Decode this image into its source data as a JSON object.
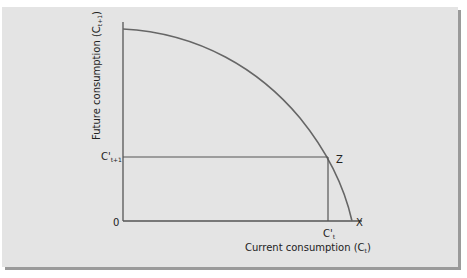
{
  "diagram": {
    "y_axis_label": "Future consumption (C",
    "y_axis_sub": "t+1",
    "y_axis_close": ")",
    "x_axis_label": "Current consumption (C",
    "x_axis_sub": "t",
    "x_axis_close": ")",
    "origin_label": "0",
    "y_tick_label": "C'",
    "y_tick_sub": "t+1",
    "x_tick_label": "C'",
    "x_tick_sub": "t",
    "point_z_label": "Z",
    "point_x_label": "X",
    "colors": {
      "panel": "#e4e4e4",
      "line": "#555555",
      "shadow": "#9a9a9a"
    }
  }
}
